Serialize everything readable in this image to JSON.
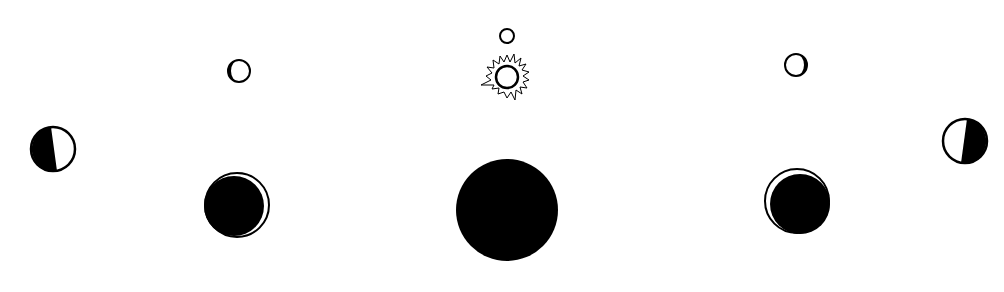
{
  "diagram": {
    "type": "moon-phase-sequence",
    "colors": {
      "ink": "#000000",
      "paper": "#ffffff"
    },
    "small_moons": [
      {
        "id": "small-moon-left",
        "cx": 239,
        "cy": 71,
        "r": 11,
        "lit_side": "right",
        "note": "thin dark crescent on left edge"
      },
      {
        "id": "small-moon-top",
        "cx": 507,
        "cy": 36,
        "r": 7,
        "lit_side": "full",
        "note": "plain circle above sun"
      },
      {
        "id": "small-moon-right",
        "cx": 796,
        "cy": 65,
        "r": 11,
        "lit_side": "left",
        "note": "thin dark crescent on right edge"
      }
    ],
    "sun": {
      "cx": 507,
      "cy": 77,
      "r": 11,
      "rays": true
    },
    "quarter_moons": [
      {
        "id": "quarter-moon-left",
        "cx": 53,
        "cy": 149,
        "r": 22,
        "dark_side": "left"
      },
      {
        "id": "quarter-moon-right",
        "cx": 965,
        "cy": 141,
        "r": 22,
        "dark_side": "right"
      }
    ],
    "crescent_moons": [
      {
        "id": "crescent-moon-left",
        "cx": 237,
        "cy": 205,
        "r": 32,
        "lit_side": "right"
      },
      {
        "id": "crescent-moon-right",
        "cx": 797,
        "cy": 201,
        "r": 32,
        "lit_side": "upper-left"
      }
    ],
    "new_moon": {
      "cx": 507,
      "cy": 210,
      "r": 51
    }
  }
}
